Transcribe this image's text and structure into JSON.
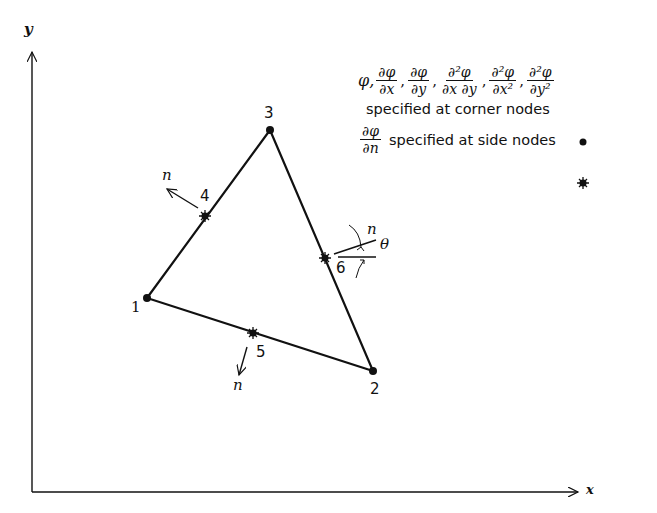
{
  "axes": {
    "x_label": "x",
    "y_label": "y"
  },
  "nodes": {
    "corner": [
      {
        "id": "1",
        "x": 147,
        "y": 298
      },
      {
        "id": "2",
        "x": 373,
        "y": 371
      },
      {
        "id": "3",
        "x": 270,
        "y": 130
      }
    ],
    "side": [
      {
        "id": "4",
        "x": 205,
        "y": 216
      },
      {
        "id": "5",
        "x": 253,
        "y": 333
      },
      {
        "id": "6",
        "x": 325,
        "y": 258
      }
    ]
  },
  "normal_label": "n",
  "angle_label": "θ",
  "legend": {
    "corner_dofs": [
      "φ",
      "∂φ/∂x",
      "∂φ/∂y",
      "∂²φ/∂x ∂y",
      "∂²φ/∂x²",
      "∂²φ/∂y²"
    ],
    "phi": "φ,",
    "f1_num": "∂φ",
    "f1_den": "∂x",
    "f2_num": "∂φ",
    "f2_den": "∂y",
    "f3_num": "∂²φ",
    "f3_den": "∂x ∂y",
    "f4_num": "∂²φ",
    "f4_den": "∂x²",
    "f5_num": "∂²φ",
    "f5_den": "∂y²",
    "comma": ",",
    "corner_text": "specified at corner nodes",
    "side_num": "∂φ",
    "side_den": "∂n",
    "side_text": "specified at side nodes"
  },
  "colors": {
    "ink": "#111111",
    "background": "#ffffff"
  }
}
